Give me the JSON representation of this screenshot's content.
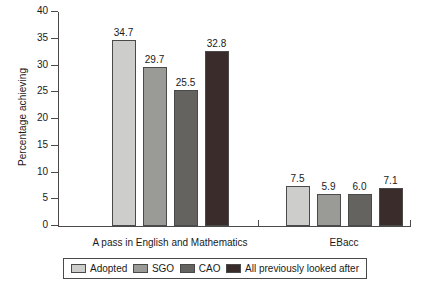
{
  "chart_data": {
    "type": "bar",
    "title": "",
    "subtitle": "",
    "xlabel": "",
    "ylabel": "Percentage achieving",
    "ylim": [
      0,
      40
    ],
    "ytick_step": 5,
    "yticks": [
      0,
      5,
      10,
      15,
      20,
      25,
      30,
      35,
      40
    ],
    "ytick_labels": [
      "0",
      "5",
      "10",
      "15",
      "20",
      "25",
      "30",
      "35",
      "40"
    ],
    "grid": false,
    "legend_position": "bottom",
    "categories": [
      "A pass in English and Mathematics",
      "EBacc"
    ],
    "series": [
      {
        "name": "Adopted",
        "color": "#cdcdcb",
        "values": [
          34.7,
          7.5
        ],
        "value_labels": [
          "34.7",
          "7.5"
        ]
      },
      {
        "name": "SGO",
        "color": "#9a9a97",
        "values": [
          29.7,
          5.9
        ],
        "value_labels": [
          "29.7",
          "5.9"
        ]
      },
      {
        "name": "CAO",
        "color": "#656360",
        "values": [
          25.5,
          6.0
        ],
        "value_labels": [
          "25.5",
          "6.0"
        ]
      },
      {
        "name": "All previously looked after",
        "color": "#3a2c2a",
        "values": [
          32.8,
          7.1
        ],
        "value_labels": [
          "32.8",
          "7.1"
        ]
      }
    ],
    "axis_color": "#4a4a4a"
  }
}
